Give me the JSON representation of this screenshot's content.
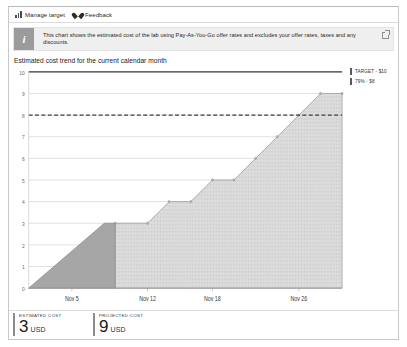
{
  "toolbar": {
    "items": [
      {
        "label": "Manage target",
        "icon": "bar-chart-icon"
      },
      {
        "label": "Feedback",
        "icon": "heart-icon"
      }
    ]
  },
  "banner": {
    "icon": "info-icon",
    "icon_glyph": "i",
    "text": "This chart shows the estimated cost of the lab using Pay-As-You-Go offer rates and excludes your offer rates, taxes and any discounts.",
    "action_icon": "open-in-new-window-icon"
  },
  "chart_data": {
    "type": "area",
    "title": "Estimated cost trend for the current calendar month",
    "xlabel": "",
    "ylabel": "",
    "ylim": [
      0,
      10
    ],
    "yticks": [
      0,
      1,
      2,
      3,
      4,
      5,
      6,
      7,
      8,
      9,
      10
    ],
    "xtick_labels": [
      "Nov 5",
      "Nov 12",
      "Nov 18",
      "Nov 26"
    ],
    "grid": true,
    "legend_position": "right",
    "legend": [
      {
        "label": "TARGET - $10",
        "color": "#595959"
      },
      {
        "label": "79% - $8",
        "color": "#595959"
      }
    ],
    "annotations": [
      {
        "type": "hline",
        "label": "TARGET - $10",
        "value": 10,
        "style": "solid"
      },
      {
        "type": "hline",
        "label": "79% - $8",
        "value": 8,
        "style": "dashed"
      }
    ],
    "series": [
      {
        "name": "Estimated cost",
        "fill": "#a0a0a0",
        "x": [
          "Nov 1",
          "Nov 8",
          "Nov 9"
        ],
        "values": [
          0,
          3,
          3
        ]
      },
      {
        "name": "Projected cost",
        "fill": "#d6d6d6",
        "x": [
          "Nov 9",
          "Nov 12",
          "Nov 14",
          "Nov 16",
          "Nov 18",
          "Nov 20",
          "Nov 22",
          "Nov 24",
          "Nov 26",
          "Nov 28",
          "Nov 30"
        ],
        "values": [
          3,
          3,
          4,
          4,
          5,
          5,
          6,
          7,
          8,
          9,
          9
        ]
      }
    ]
  },
  "metrics": [
    {
      "label": "ESTIMATED COST",
      "value": "3",
      "unit": "USD"
    },
    {
      "label": "PROJECTED COST",
      "value": "9",
      "unit": "USD"
    }
  ]
}
